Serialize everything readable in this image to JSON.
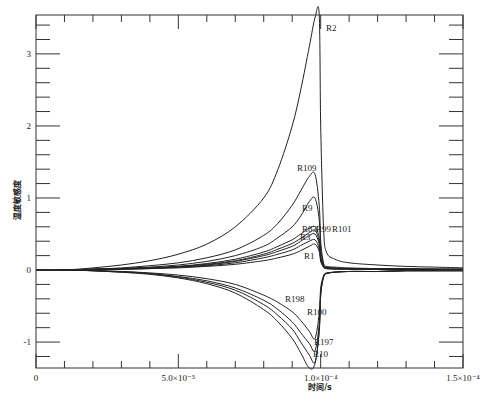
{
  "chart_data": {
    "type": "line",
    "title": "",
    "xlabel": "时间/s",
    "ylabel": "温度敏感度",
    "xlim": [
      0,
      0.00015
    ],
    "ylim": [
      -1.36,
      3.54
    ],
    "grid": false,
    "legend": "inline labels",
    "x_ticks": [
      {
        "value": 0,
        "label": "0"
      },
      {
        "value": 5e-05,
        "label": "5.0×10⁻⁵"
      },
      {
        "value": 0.0001,
        "label": "1.0×10⁻⁴"
      },
      {
        "value": 0.00015,
        "label": "1.5×10⁻⁴"
      }
    ],
    "y_ticks": [
      {
        "value": 3,
        "label": "3"
      },
      {
        "value": 2,
        "label": "2"
      },
      {
        "value": 1,
        "label": "1"
      },
      {
        "value": 0,
        "label": "0"
      },
      {
        "value": -1,
        "label": "-1"
      }
    ],
    "x": [
      0,
      1e-05,
      2e-05,
      3e-05,
      4e-05,
      5e-05,
      6e-05,
      7e-05,
      8e-05,
      8.5e-05,
      9e-05,
      9.3e-05,
      9.6e-05,
      9.8e-05,
      9.95e-05,
      0.0001,
      0.000101,
      0.000102,
      0.000105,
      0.00011,
      0.00012,
      0.00013,
      0.00014,
      0.00015
    ],
    "series": [
      {
        "name": "R2",
        "label_pos": [
          326,
          31
        ],
        "values": [
          0,
          0.0,
          0.03,
          0.07,
          0.13,
          0.22,
          0.36,
          0.6,
          1.0,
          1.4,
          2.0,
          2.5,
          3.1,
          3.5,
          3.55,
          2.0,
          0.6,
          0.25,
          0.15,
          0.1,
          0.07,
          0.05,
          0.04,
          0.03
        ]
      },
      {
        "name": "R109",
        "label_pos": [
          297,
          171
        ],
        "values": [
          0,
          0.0,
          0.01,
          0.03,
          0.06,
          0.1,
          0.17,
          0.28,
          0.48,
          0.65,
          0.9,
          1.1,
          1.3,
          1.33,
          0.9,
          0.4,
          0.1,
          0.05,
          0.04,
          0.03,
          0.02,
          0.02,
          0.01,
          0.01
        ]
      },
      {
        "name": "R9",
        "label_pos": [
          302,
          211
        ],
        "values": [
          0,
          0.0,
          0.01,
          0.02,
          0.04,
          0.07,
          0.12,
          0.2,
          0.33,
          0.45,
          0.6,
          0.75,
          0.95,
          1.0,
          0.7,
          0.3,
          0.08,
          0.04,
          0.03,
          0.02,
          0.02,
          0.01,
          0.01,
          0.01
        ]
      },
      {
        "name": "R83",
        "label_pos": [
          302,
          232
        ],
        "values": [
          0,
          0.0,
          0.01,
          0.02,
          0.03,
          0.05,
          0.09,
          0.15,
          0.25,
          0.33,
          0.42,
          0.5,
          0.58,
          0.6,
          0.45,
          0.2,
          0.06,
          0.03,
          0.02,
          0.02,
          0.01,
          0.01,
          0.01,
          0.01
        ]
      },
      {
        "name": "R99",
        "label_pos": [
          316,
          232
        ],
        "values": [
          0,
          0.0,
          0.01,
          0.02,
          0.03,
          0.05,
          0.08,
          0.13,
          0.22,
          0.29,
          0.37,
          0.44,
          0.52,
          0.55,
          0.4,
          0.18,
          0.05,
          0.03,
          0.02,
          0.02,
          0.01,
          0.01,
          0.01,
          0.01
        ]
      },
      {
        "name": "R101",
        "label_pos": [
          332,
          232
        ],
        "values": [
          0,
          0.0,
          0.01,
          0.02,
          0.03,
          0.04,
          0.07,
          0.12,
          0.2,
          0.26,
          0.33,
          0.4,
          0.48,
          0.5,
          0.36,
          0.16,
          0.05,
          0.03,
          0.02,
          0.02,
          0.01,
          0.01,
          0.01,
          0.01
        ]
      },
      {
        "name": "R3",
        "label_pos": [
          300,
          240
        ],
        "values": [
          0,
          0.0,
          0.01,
          0.01,
          0.02,
          0.04,
          0.06,
          0.1,
          0.17,
          0.22,
          0.28,
          0.34,
          0.4,
          0.42,
          0.3,
          0.14,
          0.04,
          0.02,
          0.02,
          0.01,
          0.01,
          0.01,
          0.01,
          0.01
        ]
      },
      {
        "name": "R1",
        "label_pos": [
          304,
          259
        ],
        "values": [
          0,
          0.0,
          0.0,
          0.01,
          0.02,
          0.03,
          0.05,
          0.08,
          0.13,
          0.17,
          0.22,
          0.27,
          0.33,
          0.36,
          0.26,
          0.12,
          0.04,
          0.02,
          0.01,
          0.01,
          0.01,
          0.01,
          0.01,
          0.0
        ]
      },
      {
        "name": "R198",
        "label_pos": [
          285,
          302
        ],
        "values": [
          0,
          0.0,
          -0.01,
          -0.02,
          -0.04,
          -0.07,
          -0.12,
          -0.2,
          -0.35,
          -0.45,
          -0.58,
          -0.7,
          -0.85,
          -0.95,
          -0.6,
          -0.25,
          -0.08,
          -0.04,
          -0.03,
          -0.02,
          -0.02,
          -0.01,
          -0.01,
          -0.01
        ]
      },
      {
        "name": "R100",
        "label_pos": [
          307,
          315
        ],
        "values": [
          0,
          0.0,
          -0.01,
          -0.02,
          -0.05,
          -0.09,
          -0.15,
          -0.25,
          -0.42,
          -0.55,
          -0.72,
          -0.87,
          -1.02,
          -1.12,
          -0.75,
          -0.3,
          -0.1,
          -0.05,
          -0.03,
          -0.02,
          -0.02,
          -0.01,
          -0.01,
          -0.01
        ]
      },
      {
        "name": "R197",
        "label_pos": [
          314,
          345
        ],
        "values": [
          0,
          0.0,
          -0.01,
          -0.03,
          -0.05,
          -0.1,
          -0.17,
          -0.28,
          -0.48,
          -0.63,
          -0.82,
          -1.0,
          -1.18,
          -1.28,
          -0.85,
          -0.35,
          -0.1,
          -0.05,
          -0.03,
          -0.02,
          -0.02,
          -0.01,
          -0.01,
          -0.01
        ]
      },
      {
        "name": "R10",
        "label_pos": [
          313,
          357
        ],
        "values": [
          0,
          0.0,
          -0.01,
          -0.03,
          -0.06,
          -0.11,
          -0.19,
          -0.32,
          -0.55,
          -0.72,
          -0.95,
          -1.15,
          -1.36,
          -1.3,
          -0.85,
          -0.35,
          -0.1,
          -0.05,
          -0.03,
          -0.02,
          -0.02,
          -0.01,
          -0.01,
          -0.01
        ]
      }
    ]
  }
}
